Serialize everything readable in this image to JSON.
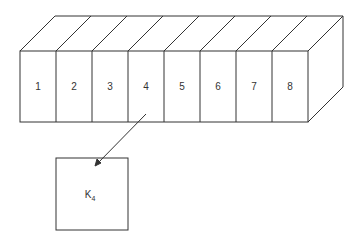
{
  "diagram": {
    "block": {
      "slice_count": 8,
      "slices": [
        {
          "label": "1"
        },
        {
          "label": "2"
        },
        {
          "label": "3"
        },
        {
          "label": "4"
        },
        {
          "label": "5"
        },
        {
          "label": "6"
        },
        {
          "label": "7"
        },
        {
          "label": "8"
        }
      ]
    },
    "detail_box": {
      "label_main": "K",
      "label_sub": "4",
      "source_slice": "4"
    },
    "colors": {
      "stroke": "#333333",
      "background": "#ffffff"
    }
  }
}
